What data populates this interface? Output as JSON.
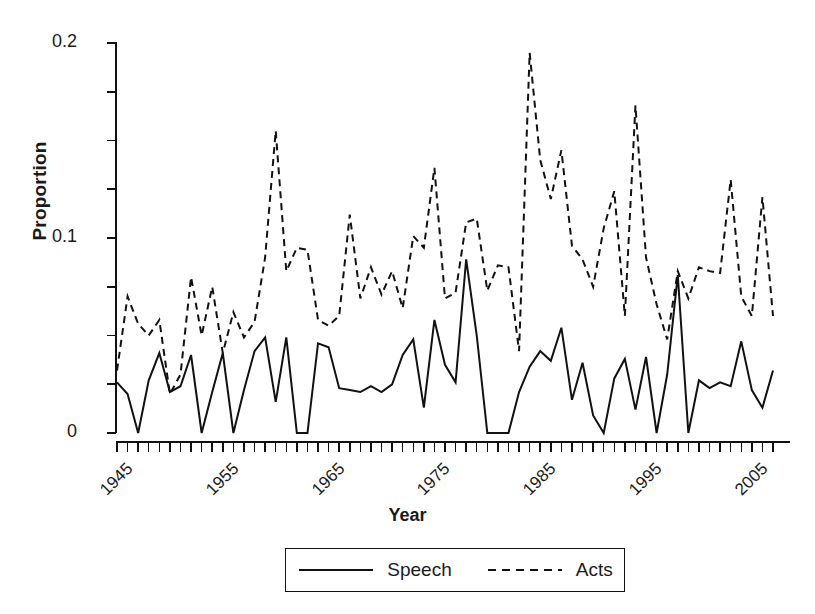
{
  "chart_data": {
    "type": "line",
    "title": "",
    "xlabel": "Year",
    "ylabel": "Proportion",
    "xlim": [
      1945,
      2007
    ],
    "ylim": [
      0,
      0.2
    ],
    "y_ticks_major": [
      0,
      0.1,
      0.2
    ],
    "y_tick_labels": [
      "0",
      "0.1",
      "0.2"
    ],
    "y_ticks_minor_step": 0.025,
    "x_ticks_labeled": [
      1945,
      1955,
      1965,
      1975,
      1985,
      1995,
      2005
    ],
    "x_tick_labels": [
      "1945",
      "1955",
      "1965",
      "1975",
      "1985",
      "1995",
      "2005"
    ],
    "x_ticks_minor_step": 1,
    "grid": false,
    "legend_position": "bottom-center",
    "line_color": "#111111",
    "x": [
      1945,
      1946,
      1947,
      1948,
      1949,
      1950,
      1951,
      1952,
      1953,
      1954,
      1955,
      1956,
      1957,
      1958,
      1959,
      1960,
      1961,
      1962,
      1963,
      1964,
      1965,
      1966,
      1967,
      1968,
      1969,
      1970,
      1971,
      1972,
      1973,
      1974,
      1975,
      1976,
      1977,
      1978,
      1979,
      1980,
      1981,
      1982,
      1983,
      1984,
      1985,
      1986,
      1987,
      1988,
      1989,
      1990,
      1991,
      1992,
      1993,
      1994,
      1995,
      1996,
      1997,
      1998,
      1999,
      2000,
      2001,
      2002,
      2003,
      2004,
      2005,
      2006,
      2007
    ],
    "series": [
      {
        "name": "Speech",
        "dash": "solid",
        "values": [
          0.026,
          0.02,
          0.0,
          0.027,
          0.041,
          0.021,
          0.024,
          0.04,
          0.0,
          0.021,
          0.041,
          0.0,
          0.022,
          0.042,
          0.049,
          0.016,
          0.049,
          0.0,
          0.0,
          0.046,
          0.044,
          0.023,
          0.022,
          0.021,
          0.024,
          0.021,
          0.025,
          0.04,
          0.048,
          0.013,
          0.058,
          0.035,
          0.026,
          0.089,
          0.05,
          0.0,
          0.0,
          0.0,
          0.021,
          0.034,
          0.042,
          0.037,
          0.054,
          0.017,
          0.036,
          0.009,
          0.0,
          0.028,
          0.038,
          0.012,
          0.039,
          0.0,
          0.03,
          0.081,
          0.0,
          0.027,
          0.023,
          0.026,
          0.024,
          0.047,
          0.022,
          0.013,
          0.032
        ]
      },
      {
        "name": "Acts",
        "dash": "dashed",
        "values": [
          0.032,
          0.07,
          0.056,
          0.05,
          0.058,
          0.02,
          0.03,
          0.08,
          0.05,
          0.075,
          0.041,
          0.062,
          0.049,
          0.057,
          0.09,
          0.155,
          0.083,
          0.095,
          0.094,
          0.058,
          0.055,
          0.06,
          0.112,
          0.069,
          0.085,
          0.071,
          0.083,
          0.064,
          0.101,
          0.095,
          0.136,
          0.069,
          0.072,
          0.108,
          0.11,
          0.073,
          0.086,
          0.085,
          0.042,
          0.195,
          0.14,
          0.12,
          0.145,
          0.096,
          0.089,
          0.075,
          0.105,
          0.124,
          0.06,
          0.168,
          0.09,
          0.066,
          0.048,
          0.083,
          0.069,
          0.085,
          0.083,
          0.082,
          0.13,
          0.07,
          0.06,
          0.121,
          0.06
        ]
      }
    ]
  },
  "legend": {
    "entries": [
      {
        "label": "Speech",
        "style": "solid"
      },
      {
        "label": "Acts",
        "style": "dashed"
      }
    ]
  }
}
